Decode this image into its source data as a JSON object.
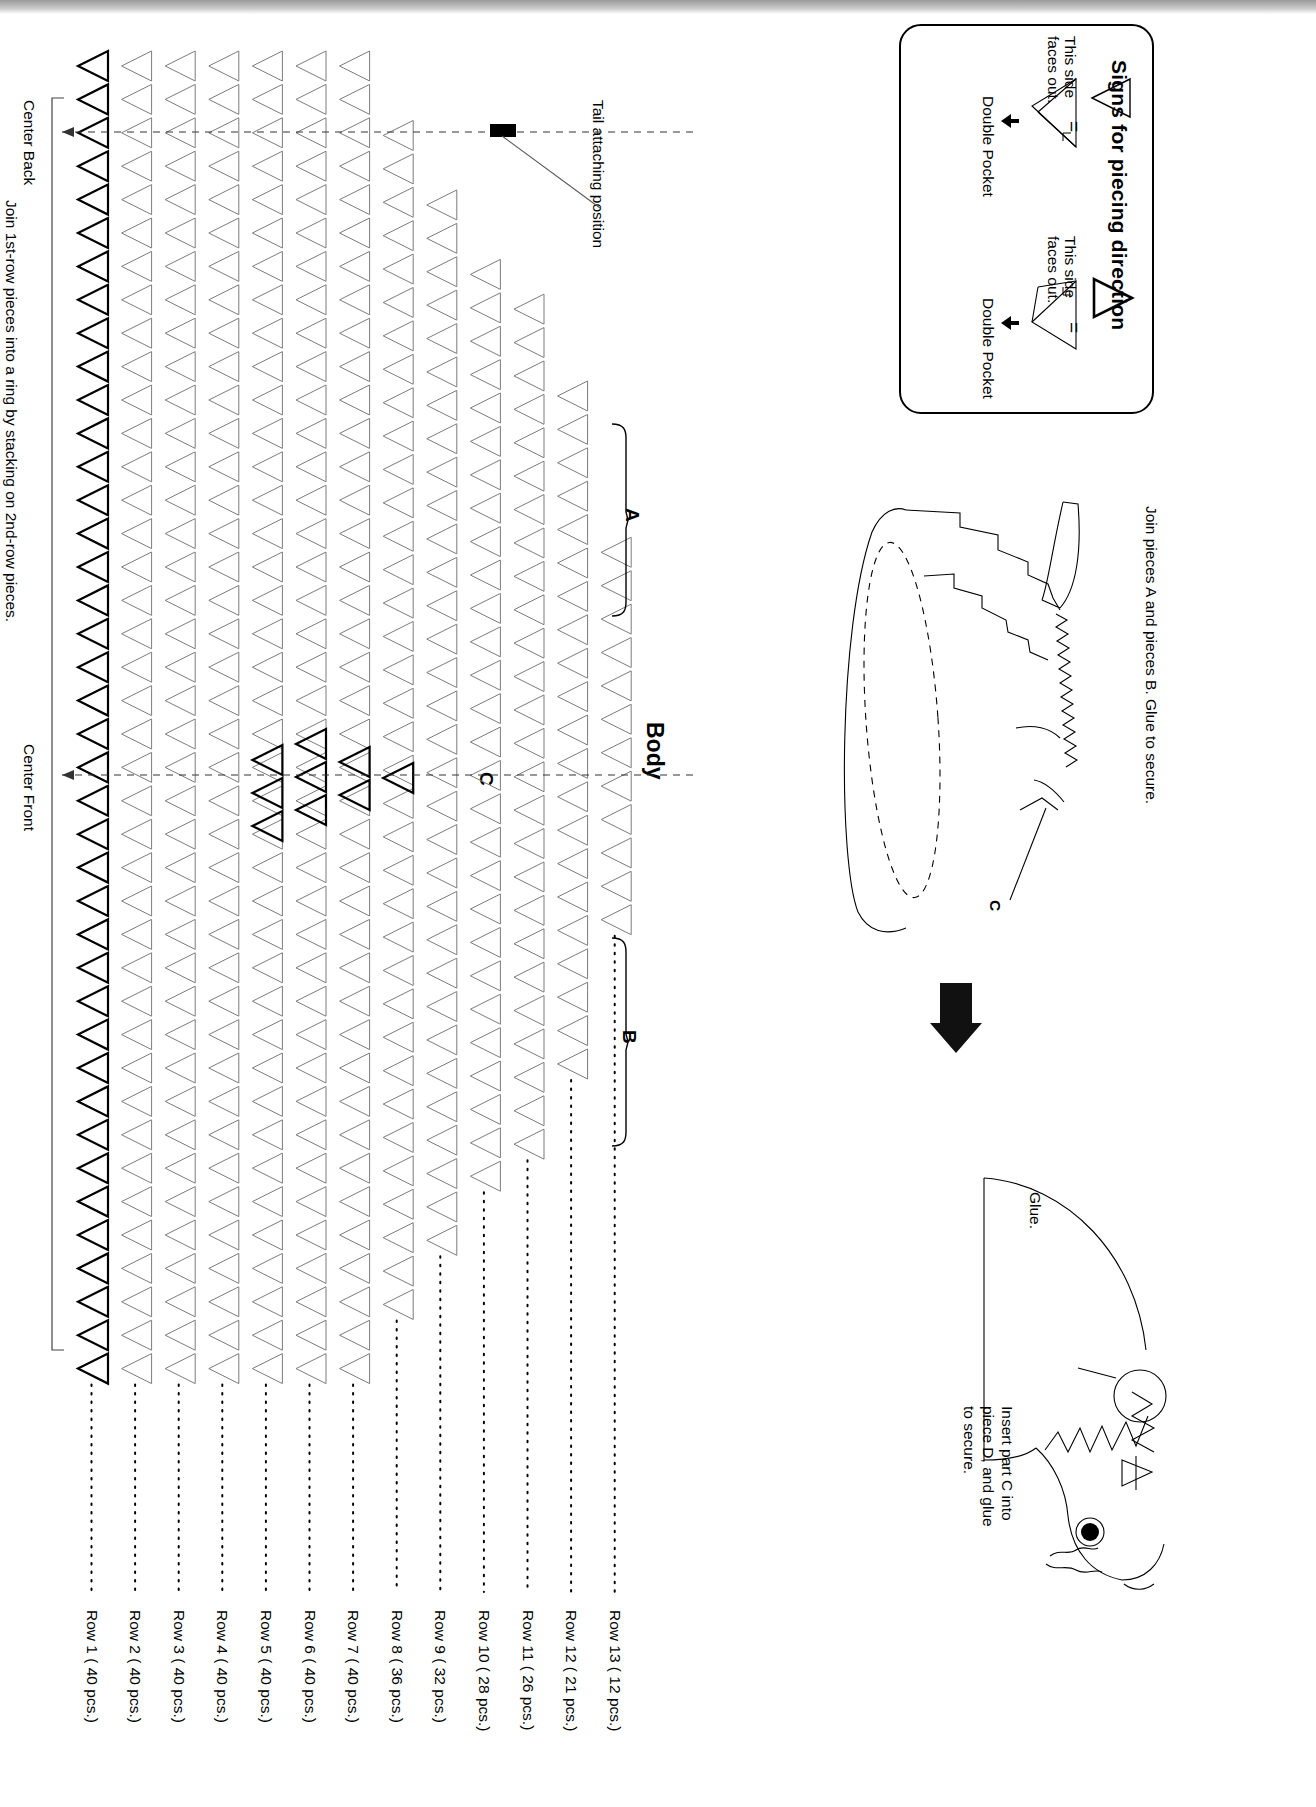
{
  "page": {
    "orientation": "rotated-90-clockwise",
    "kind": "craft instruction sheet"
  },
  "legend": {
    "title": "Signs for piecing direction",
    "entries": [
      {
        "glyph": "outline-triangle-left",
        "equals": "=",
        "side_note": "This side\nfaces out.",
        "side_note_line1": "This side",
        "side_note_line2": "faces out.",
        "pocket_label": "Double Pocket"
      },
      {
        "glyph": "bold-triangle-right",
        "equals": "=",
        "side_note_line1": "This side",
        "side_note_line2": "faces out.",
        "pocket_label": "Double Pocket"
      }
    ]
  },
  "right_panel": {
    "step1_caption": "Join pieces A and pieces B. Glue to secure.",
    "step1_part_label": "C",
    "arrow": "down-arrow",
    "step2_glue_label": "Glue.",
    "step2_caption_line1": "Insert part C into",
    "step2_caption_line2": "piece D, and glue",
    "step2_caption_line3": "to secure."
  },
  "main": {
    "title": "Body",
    "tail_label": "Tail attaching position",
    "center_back_label": "Center Back",
    "center_front_label": "Center Front",
    "ring_note": "Join 1st-row pieces into a ring by stacking on 2nd-row pieces.",
    "bracket_a": "A",
    "bracket_b": "B",
    "marker_c": "C",
    "rows": [
      {
        "label": "Row  1 ( 40  pcs.)",
        "n": 40,
        "count_text": "40 pcs."
      },
      {
        "label": "Row  2 ( 40  pcs.)",
        "n": 40,
        "count_text": "40 pcs."
      },
      {
        "label": "Row  3 ( 40  pcs.)",
        "n": 40,
        "count_text": "40 pcs."
      },
      {
        "label": "Row  4 ( 40  pcs.)",
        "n": 40,
        "count_text": "40 pcs."
      },
      {
        "label": "Row  5 ( 40  pcs.)",
        "n": 40,
        "count_text": "40 pcs."
      },
      {
        "label": "Row  6 ( 40  pcs.)",
        "n": 40,
        "count_text": "40 pcs."
      },
      {
        "label": "Row  7 ( 40  pcs.)",
        "n": 40,
        "count_text": "40 pcs."
      },
      {
        "label": "Row  8 ( 36  pcs.)",
        "n": 36,
        "count_text": "36 pcs."
      },
      {
        "label": "Row  9 ( 32  pcs.)",
        "n": 32,
        "count_text": "32 pcs."
      },
      {
        "label": "Row 10 ( 28  pcs.)",
        "n": 28,
        "count_text": "28 pcs."
      },
      {
        "label": "Row 11 ( 26  pcs.)",
        "n": 26,
        "count_text": "26 pcs."
      },
      {
        "label": "Row 12 ( 21  pcs.)",
        "n": 21,
        "count_text": "21 pcs."
      },
      {
        "label": "Row 13 ( 12  pcs.)",
        "n": 12,
        "count_text": "12 pcs."
      }
    ]
  },
  "colors": {
    "ink": "#000000",
    "light_ink": "#6b6b6b",
    "paper": "#ffffff"
  }
}
